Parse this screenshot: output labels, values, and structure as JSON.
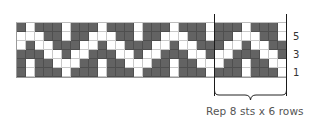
{
  "chart_data": {
    "type": "table",
    "columns": 30,
    "rows_count": 6,
    "cell_size_px": 9,
    "repeat": {
      "stitches": 8,
      "rows": 6,
      "start_column": 22,
      "end_column": 29
    },
    "row_labels": [
      "5",
      "3",
      "1"
    ],
    "colors": {
      "dark": "#636363",
      "light": "#ffffff"
    },
    "pattern_repeat_rows_top_to_bottom": [
      {
        "row": 6,
        "cells": [
          1,
          0,
          1,
          1,
          1,
          0,
          1,
          1
        ]
      },
      {
        "row": 5,
        "cells": [
          0,
          0,
          0,
          1,
          1,
          0,
          1,
          1
        ]
      },
      {
        "row": 4,
        "cells": [
          0,
          1,
          0,
          0,
          1,
          1,
          1,
          0
        ]
      },
      {
        "row": 3,
        "cells": [
          1,
          1,
          1,
          0,
          0,
          1,
          0,
          0
        ]
      },
      {
        "row": 2,
        "cells": [
          1,
          0,
          1,
          1,
          0,
          0,
          0,
          1
        ]
      },
      {
        "row": 1,
        "cells": [
          1,
          0,
          1,
          1,
          1,
          0,
          1,
          1
        ]
      }
    ]
  },
  "labels": {
    "row5": "5",
    "row3": "3",
    "row1": "1",
    "caption": "Rep 8 sts x 6 rows"
  }
}
